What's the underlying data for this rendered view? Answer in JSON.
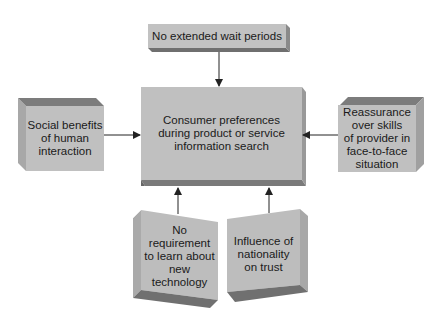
{
  "diagram": {
    "title": "Consumer preferences during product or service information search",
    "center": {
      "lines": [
        "Consumer preferences",
        "during product or service",
        "information search"
      ]
    },
    "nodes": {
      "top": {
        "lines": [
          "No extended wait periods"
        ]
      },
      "left": {
        "lines": [
          "Social benefits",
          "of human",
          "interaction"
        ]
      },
      "right": {
        "lines": [
          "Reassurance",
          "over skills",
          "of provider in",
          "face-to-face",
          "situation"
        ]
      },
      "bottom_left": {
        "lines": [
          "No",
          "requirement",
          "to learn about",
          "new technology"
        ]
      },
      "bottom_right": {
        "lines": [
          "Influence of",
          "nationality",
          "on trust"
        ]
      }
    },
    "edges": [
      {
        "from": "top",
        "to": "center"
      },
      {
        "from": "left",
        "to": "center"
      },
      {
        "from": "right",
        "to": "center"
      },
      {
        "from": "bottom_left",
        "to": "center"
      },
      {
        "from": "bottom_right",
        "to": "center"
      }
    ],
    "colors": {
      "face": "#bdbdbd",
      "top_face": "#8c8c8c",
      "side_face": "#9a9a9a",
      "bottom_face": "#7a7a7a",
      "arrow": "#222222"
    }
  }
}
